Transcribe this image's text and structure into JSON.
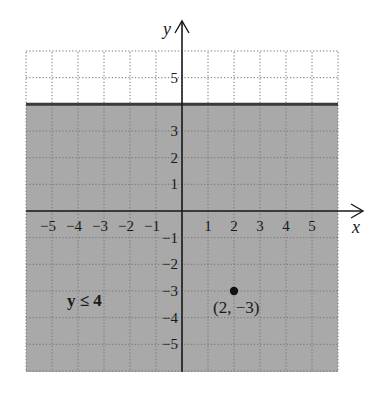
{
  "chart_data": {
    "type": "scatter",
    "title": "",
    "xlabel": "x",
    "ylabel": "y",
    "xlim": [
      -6,
      6
    ],
    "ylim": [
      -6,
      6
    ],
    "grid": true,
    "grid_style": "dotted",
    "x_ticks": [
      -5,
      -4,
      -3,
      -2,
      -1,
      1,
      2,
      3,
      4,
      5
    ],
    "y_ticks": [
      -5,
      -4,
      -3,
      -2,
      -1,
      1,
      2,
      3,
      5
    ],
    "x_tick_labels": [
      "−5",
      "−4",
      "−3",
      "−2",
      "−1",
      "1",
      "2",
      "3",
      "4",
      "5"
    ],
    "y_tick_labels": [
      "−5",
      "−4",
      "−3",
      "−2",
      "−1",
      "1",
      "2",
      "3",
      "5"
    ],
    "boundary_line": {
      "equation": "y = 4",
      "style": "solid"
    },
    "shaded_region": {
      "inequality": "y ≤ 4",
      "label": "y ≤ 4",
      "color": "#a9a9a9"
    },
    "points": [
      {
        "x": 2,
        "y": -3,
        "label": "(2, −3)"
      }
    ]
  },
  "labels": {
    "x_axis": "x",
    "y_axis": "y",
    "inequality": "y ≤ 4",
    "point": "(2, −3)"
  },
  "colors": {
    "shade": "#a9a9a9",
    "grid": "#777777",
    "axis": "#1a1a1a",
    "boundary": "#3a3a3a"
  }
}
